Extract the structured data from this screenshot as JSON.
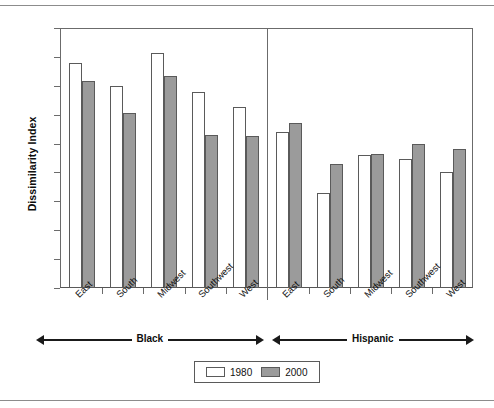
{
  "chart_data": {
    "type": "bar",
    "title": "",
    "xlabel": "",
    "ylabel": "Dissimilarity Index",
    "ylim": [
      0,
      90
    ],
    "ytick_values": [
      0,
      10,
      20,
      30,
      40,
      50,
      60,
      70,
      80,
      90
    ],
    "grid": false,
    "legend_position": "bottom-center",
    "categories": [
      "East",
      "South",
      "Midwest",
      "Southwest",
      "West",
      "East",
      "South",
      "Midwest",
      "Southwest",
      "West"
    ],
    "groups": [
      {
        "name": "Black",
        "categories": [
          "East",
          "South",
          "Midwest",
          "Southwest",
          "West"
        ]
      },
      {
        "name": "Hispanic",
        "categories": [
          "East",
          "South",
          "Midwest",
          "Southwest",
          "West"
        ]
      }
    ],
    "series": [
      {
        "name": "1980",
        "color": "#ffffff",
        "values": [
          78,
          70,
          81.5,
          68,
          62.5,
          54,
          33,
          46,
          44.5,
          40
        ]
      },
      {
        "name": "2000",
        "color": "#9b9b9b",
        "values": [
          71.5,
          60.5,
          73.5,
          53,
          52.5,
          57,
          43,
          46.5,
          50,
          48
        ]
      }
    ]
  }
}
